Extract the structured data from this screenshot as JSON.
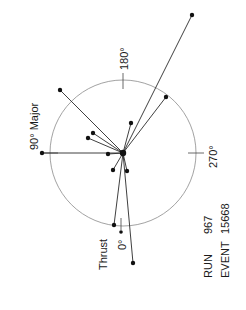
{
  "diagram": {
    "type": "polar-vector-plot",
    "center": {
      "x": 123,
      "y": 153
    },
    "circle_radius": 73,
    "colors": {
      "circle": "#8a8a8a",
      "vector": "#2a2a2a",
      "endpoint": "#111111",
      "text": "#1a1a1a",
      "background": "#ffffff"
    },
    "axis_labels": {
      "deg_0": "0°",
      "deg_90": "90° Major",
      "deg_180": "180°",
      "deg_270": "270°",
      "thrust": "Thrust"
    },
    "info": {
      "run_label": "RUN",
      "run_value": "967",
      "event_label": "EVENT",
      "event_value": "15668"
    },
    "vectors": [
      {
        "x": 192,
        "y": 15
      },
      {
        "x": 166,
        "y": 97
      },
      {
        "x": 60,
        "y": 90
      },
      {
        "x": 131,
        "y": 123
      },
      {
        "x": 93,
        "y": 133
      },
      {
        "x": 88,
        "y": 138
      },
      {
        "x": 42,
        "y": 153
      },
      {
        "x": 108,
        "y": 154
      },
      {
        "x": 113,
        "y": 170
      },
      {
        "x": 127,
        "y": 171
      },
      {
        "x": 114,
        "y": 225
      },
      {
        "x": 133,
        "y": 263
      }
    ]
  }
}
